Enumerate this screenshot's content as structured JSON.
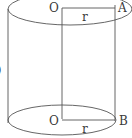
{
  "figure": {
    "labels": {
      "top_center": "O",
      "bottom_center": "O",
      "top_point": "A",
      "bottom_point": "B",
      "top_radius": "r",
      "bottom_radius": "r",
      "clipped_left_glyph": ")"
    },
    "colors": {
      "stroke": "#555555",
      "text": "#3a3a3a",
      "background": "#ffffff"
    }
  }
}
